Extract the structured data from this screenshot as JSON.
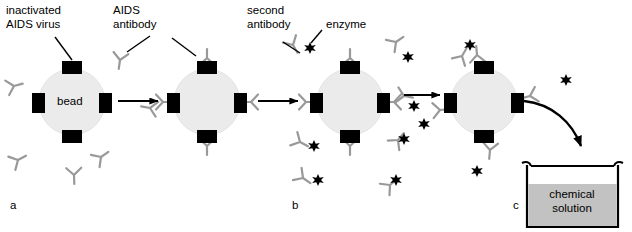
{
  "figure": {
    "title_visible": false,
    "background_color": "#ffffff"
  },
  "colors": {
    "bead_fill": "#ebebeb",
    "bead_stroke": "#e0e0e0",
    "virus_block": "#000000",
    "antibody": "#999999",
    "enzyme": "#000000",
    "arrow": "#000000",
    "beaker_outline": "#000000",
    "solution_fill": "#c2c2c2",
    "text": "#000000",
    "leader_line": "#000000"
  },
  "labels": {
    "inactivated_virus": "inactivated\nAIDS virus",
    "aids_antibody": "AIDS\nantibody",
    "second_antibody": "second\nantibody",
    "enzyme": "enzyme",
    "bead": "bead",
    "chemical_solution": "chemical\nsolution"
  },
  "panels": [
    {
      "letter": "a",
      "x": 10,
      "y": 205
    },
    {
      "letter": "b",
      "x": 292,
      "y": 205
    },
    {
      "letter": "c",
      "x": 521,
      "y": 205
    }
  ],
  "beads": [
    {
      "id": "bead-1",
      "cx": 72,
      "cy": 102,
      "r": 33,
      "has_label": true,
      "antibodies_bound": 0,
      "enzymes_bound": 0
    },
    {
      "id": "bead-2",
      "cx": 207,
      "cy": 102,
      "r": 33,
      "has_label": false,
      "antibodies_bound": 4,
      "enzymes_bound": 0
    },
    {
      "id": "bead-3",
      "cx": 350,
      "cy": 102,
      "r": 33,
      "has_label": false,
      "antibodies_bound": 4,
      "enzymes_bound": 0
    },
    {
      "id": "bead-4",
      "cx": 484,
      "cy": 102,
      "r": 33,
      "has_label": false,
      "antibodies_bound": 4,
      "enzymes_bound": 0
    }
  ],
  "virus_blocks_per_bead": 4,
  "arrows": [
    {
      "id": "arrow-1",
      "x1": 118,
      "y1": 101,
      "x2": 160,
      "y2": 101,
      "type": "straight"
    },
    {
      "id": "arrow-2",
      "x1": 258,
      "y1": 101,
      "x2": 300,
      "y2": 101,
      "type": "straight"
    },
    {
      "id": "arrow-3",
      "x1": 404,
      "y1": 95,
      "x2": 442,
      "y2": 95,
      "type": "straight"
    },
    {
      "id": "arrow-4",
      "type": "curved",
      "from": "bead-4",
      "to": "beaker"
    }
  ],
  "beaker": {
    "x": 525,
    "y": 160,
    "width": 95,
    "height": 67,
    "fill_level_fraction": 0.72
  },
  "step_descriptions": {
    "a": "Bead coated with inactivated AIDS virus; free AIDS antibodies in solution",
    "b": "AIDS antibodies bound to virus on bead; enzyme-linked second antibodies added",
    "c": "Enzyme-labeled complex transferred into chemical solution"
  }
}
